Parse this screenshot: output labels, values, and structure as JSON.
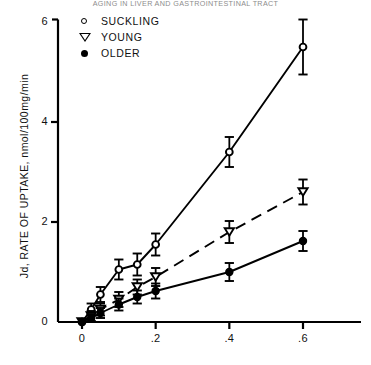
{
  "running_head": "AGING IN LIVER AND GASTROINTESTINAL TRACT",
  "axes": {
    "ylabel": "Jd, RATE OF UPTAKE, nmol/100mg/min",
    "xlabel": "",
    "yticks": [
      "0",
      "2",
      "4",
      "6"
    ],
    "xticks": [
      "0",
      ".2",
      ".4",
      ".6"
    ]
  },
  "legend": {
    "items": [
      {
        "label": "SUCKLING",
        "marker": "open-circle"
      },
      {
        "label": "YOUNG",
        "marker": "open-triangle-down"
      },
      {
        "label": "OLDER",
        "marker": "filled-circle"
      }
    ]
  },
  "chart_data": {
    "type": "scatter",
    "title": "AGING IN LIVER AND GASTROINTESTINAL TRACT",
    "xlabel": "",
    "ylabel": "Jd, RATE OF UPTAKE, nmol/100mg/min",
    "xlim": [
      -0.03,
      0.68
    ],
    "ylim": [
      0,
      6.2
    ],
    "xticks": [
      0,
      0.2,
      0.4,
      0.6
    ],
    "xticklabels": [
      "0",
      ".2",
      ".4",
      ".6"
    ],
    "yticks": [
      0,
      2,
      4,
      6
    ],
    "yticklabels": [
      "0",
      "2",
      "4",
      "6"
    ],
    "grid": false,
    "legend_position": "upper-left",
    "series": [
      {
        "name": "SUCKLING",
        "marker": "open-circle",
        "linestyle": "solid",
        "color": "#000000",
        "x": [
          0.0,
          0.025,
          0.05,
          0.1,
          0.15,
          0.2,
          0.4,
          0.6
        ],
        "y": [
          0.0,
          0.25,
          0.55,
          1.05,
          1.15,
          1.55,
          3.4,
          5.5
        ],
        "yerr": [
          0.0,
          0.12,
          0.15,
          0.2,
          0.22,
          0.22,
          0.3,
          0.55
        ]
      },
      {
        "name": "YOUNG",
        "marker": "open-triangle-down",
        "linestyle": "dashed",
        "color": "#000000",
        "x": [
          0.0,
          0.025,
          0.05,
          0.1,
          0.15,
          0.2,
          0.4,
          0.6
        ],
        "y": [
          0.0,
          0.12,
          0.25,
          0.45,
          0.7,
          0.9,
          1.8,
          2.6
        ],
        "yerr": [
          0.0,
          0.1,
          0.12,
          0.15,
          0.15,
          0.18,
          0.22,
          0.25
        ]
      },
      {
        "name": "OLDER",
        "marker": "filled-circle",
        "linestyle": "solid",
        "color": "#000000",
        "x": [
          0.0,
          0.025,
          0.05,
          0.1,
          0.15,
          0.2,
          0.4,
          0.6
        ],
        "y": [
          0.0,
          0.08,
          0.18,
          0.35,
          0.5,
          0.62,
          1.0,
          1.62
        ],
        "yerr": [
          0.0,
          0.08,
          0.1,
          0.12,
          0.13,
          0.15,
          0.18,
          0.2
        ]
      }
    ]
  },
  "plot_geometry": {
    "x_px": {
      "0": 82,
      "0.6": 303
    },
    "y_px": {
      "0": 322,
      "6": 22
    }
  }
}
